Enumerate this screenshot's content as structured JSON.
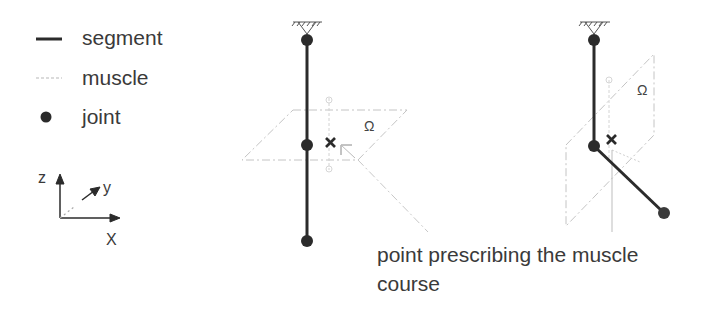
{
  "legend": {
    "items": [
      {
        "label": "segment",
        "symbol": "line-icon"
      },
      {
        "label": "muscle",
        "symbol": "dashed-line-icon"
      },
      {
        "label": "joint",
        "symbol": "dot-icon"
      }
    ]
  },
  "axes": {
    "z": "z",
    "y": "y",
    "x": "X"
  },
  "diagram_left": {
    "plane_label": "Ω"
  },
  "diagram_right": {
    "plane_label": "Ω"
  },
  "caption": {
    "text": "point prescribing the muscle course"
  },
  "colors": {
    "segment": "#2b2b2b",
    "muscle": "#c8c8c8",
    "plane": "#bdbdbd",
    "text": "#3a3a3a"
  }
}
